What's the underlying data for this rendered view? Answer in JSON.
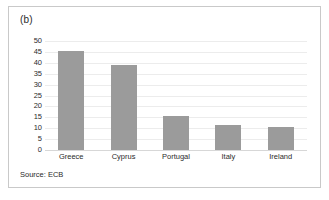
{
  "figure": {
    "panel_label": "(b)",
    "source_note": "Source: ECB",
    "bar_color": "#9b9b9b",
    "grid_color": "#ececec",
    "text_color": "#2b2b2b",
    "border_color": "#c9c9c9"
  },
  "chart_data": {
    "type": "bar",
    "title": "",
    "subtitle": "",
    "xlabel": "",
    "ylabel": "",
    "categories": [
      "Greece",
      "Cyprus",
      "Portugal",
      "Italy",
      "Ireland"
    ],
    "values": [
      45.3,
      39,
      15.5,
      11.5,
      10.5
    ],
    "ylim": [
      0,
      50
    ],
    "yticks": [
      0,
      5,
      10,
      15,
      20,
      25,
      30,
      35,
      40,
      45,
      50
    ],
    "ytick_labels": [
      "0",
      "5",
      "10",
      "15",
      "20",
      "25",
      "30",
      "35",
      "40",
      "45",
      "50"
    ],
    "grid": true,
    "legend": false,
    "annotations": [
      "(b)",
      "Source: ECB"
    ]
  }
}
